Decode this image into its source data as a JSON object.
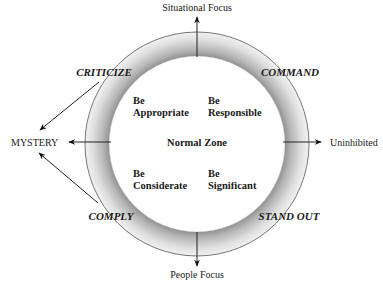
{
  "diagram": {
    "axes": {
      "top": "Situational Focus",
      "bottom": "People Focus",
      "left": "MYSTERY",
      "right": "Uninhibited"
    },
    "ring_modes": {
      "top_left": "CRITICIZE",
      "top_right": "COMMAND",
      "bottom_left": "COMPLY",
      "bottom_right": "STAND OUT"
    },
    "center": {
      "title": "Normal Zone",
      "quadrants": {
        "top_left": [
          "Be",
          "Appropriate"
        ],
        "top_right": [
          "Be",
          "Responsible"
        ],
        "bottom_left": [
          "Be",
          "Considerate"
        ],
        "bottom_right": [
          "Be",
          "Significant"
        ]
      }
    },
    "colors": {
      "ring_outer_shade": "#b8b8b8",
      "ring_inner_shade": "#f4f4f4",
      "stroke": "#222222"
    }
  }
}
